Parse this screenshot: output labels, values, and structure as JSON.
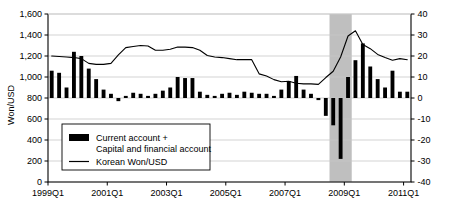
{
  "chart_data": {
    "type": "bar",
    "title": "",
    "xlabel": "",
    "ylabel": "Won/USD",
    "y2label": "",
    "ylim": [
      0,
      1600
    ],
    "y2lim": [
      -40,
      40
    ],
    "grid": true,
    "legend_position": "inside-bottom-left",
    "y_ticks": [
      "0",
      "200",
      "400",
      "600",
      "800",
      "1,000",
      "1,200",
      "1,400",
      "1,600"
    ],
    "y_tick_values": [
      0,
      200,
      400,
      600,
      800,
      1000,
      1200,
      1400,
      1600
    ],
    "y2_ticks": [
      "-40",
      "-30",
      "-20",
      "-10",
      "0",
      "10",
      "20",
      "30",
      "40"
    ],
    "y2_tick_values": [
      -40,
      -30,
      -20,
      -10,
      0,
      10,
      20,
      30,
      40
    ],
    "x_tick_labels": [
      "1999Q1",
      "2001Q1",
      "2003Q1",
      "2005Q1",
      "2007Q1",
      "2009Q1",
      "2011Q1"
    ],
    "x_tick_quarters": [
      "1999Q1",
      "2001Q1",
      "2003Q1",
      "2005Q1",
      "2007Q1",
      "2009Q1",
      "2011Q1"
    ],
    "quarters": [
      "1999Q1",
      "1999Q2",
      "1999Q3",
      "1999Q4",
      "2000Q1",
      "2000Q2",
      "2000Q3",
      "2000Q4",
      "2001Q1",
      "2001Q2",
      "2001Q3",
      "2001Q4",
      "2002Q1",
      "2002Q2",
      "2002Q3",
      "2002Q4",
      "2003Q1",
      "2003Q2",
      "2003Q3",
      "2003Q4",
      "2004Q1",
      "2004Q2",
      "2004Q3",
      "2004Q4",
      "2005Q1",
      "2005Q2",
      "2005Q3",
      "2005Q4",
      "2006Q1",
      "2006Q2",
      "2006Q3",
      "2006Q4",
      "2007Q1",
      "2007Q2",
      "2007Q3",
      "2007Q4",
      "2008Q1",
      "2008Q2",
      "2008Q3",
      "2008Q4",
      "2009Q1",
      "2009Q2",
      "2009Q3",
      "2009Q4",
      "2010Q1",
      "2010Q2",
      "2010Q3",
      "2010Q4",
      "2011Q1"
    ],
    "series": [
      {
        "name": "Current account + Capital and financial account",
        "type": "bar",
        "axis": "right",
        "unit": "USD billion",
        "color": "#000000",
        "values": [
          13.0,
          12.0,
          5.0,
          22.0,
          20.0,
          14.0,
          9.0,
          4.0,
          2.0,
          -1.5,
          1.0,
          2.5,
          2.0,
          1.0,
          2.0,
          3.5,
          5.0,
          10.0,
          9.5,
          9.5,
          3.0,
          1.5,
          1.0,
          2.0,
          2.5,
          1.5,
          3.0,
          2.5,
          2.0,
          2.0,
          1.0,
          4.0,
          8.0,
          10.5,
          4.0,
          2.0,
          -1.0,
          -8.5,
          -13.0,
          -29.0,
          10.0,
          18.0,
          26.0,
          15.0,
          9.0,
          5.0,
          13.0,
          3.0,
          3.0
        ]
      },
      {
        "name": "Korean Won/USD",
        "type": "line",
        "axis": "left",
        "unit": "Won per USD",
        "color": "#000000",
        "values": [
          1200,
          1195,
          1190,
          1185,
          1175,
          1130,
          1120,
          1120,
          1130,
          1210,
          1280,
          1290,
          1300,
          1295,
          1255,
          1255,
          1265,
          1285,
          1285,
          1280,
          1255,
          1205,
          1190,
          1185,
          1175,
          1165,
          1165,
          1165,
          1030,
          1010,
          975,
          955,
          960,
          940,
          935,
          935,
          930,
          995,
          1055,
          1190,
          1390,
          1440,
          1310,
          1270,
          1215,
          1185,
          1160,
          1175,
          1165
        ]
      }
    ],
    "annotations": [
      {
        "type": "shaded-band",
        "name": "crisis-highlight-band",
        "from": "2008Q3",
        "to": "2009Q1",
        "color": "#bfbfbf"
      }
    ],
    "legend": {
      "items": [
        {
          "marker": "bar",
          "line1": "Current account +",
          "line2": "Capital and financial account"
        },
        {
          "marker": "line",
          "line1": "Korean Won/USD",
          "line2": ""
        }
      ]
    }
  }
}
